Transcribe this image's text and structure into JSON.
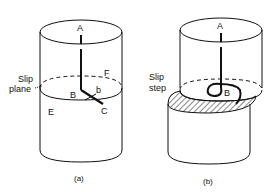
{
  "figure_a": {
    "caption": "(a)",
    "slip_label_line1": "Slip",
    "slip_label_line2": "plane",
    "points": {
      "A": "A",
      "B": "B",
      "b": "b",
      "C": "C",
      "E": "E",
      "F": "F"
    }
  },
  "figure_b": {
    "caption": "(b)",
    "slip_label_line1": "Slip",
    "slip_label_line2": "step",
    "points": {
      "A": "A",
      "B": "B"
    }
  },
  "colors": {
    "ink": "#111111",
    "background": "#ffffff"
  }
}
